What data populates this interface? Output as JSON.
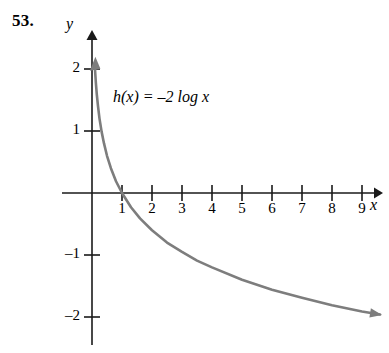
{
  "figure": {
    "problem_number": "53.",
    "equation": {
      "function_name": "h",
      "argument": "x",
      "full_text": "h(x) = –2 log x",
      "coefficient": "–2",
      "base_function": "log"
    },
    "axes": {
      "x_label": "x",
      "y_label": "y",
      "x_ticks": [
        "1",
        "2",
        "3",
        "4",
        "5",
        "6",
        "7",
        "8",
        "9"
      ],
      "y_ticks": [
        "2",
        "1",
        "–1",
        "–2"
      ],
      "x_range": [
        -0.9,
        9.9
      ],
      "y_range": [
        -2.4,
        2.5
      ],
      "grid": false,
      "axis_color": "#1a1a1a"
    },
    "curve": {
      "color": "#7d7d7d",
      "width": 2.6,
      "arrow_start": "up",
      "arrow_end": "right"
    }
  },
  "chart_data": {
    "type": "line",
    "title": "",
    "xlabel": "x",
    "ylabel": "y",
    "xlim": [
      -0.9,
      9.9
    ],
    "ylim": [
      -2.4,
      2.5
    ],
    "grid": false,
    "legend": null,
    "annotations": [
      "h(x) = –2 log x"
    ],
    "series": [
      {
        "name": "h(x) = -2 log x",
        "x": [
          0.097,
          0.11,
          0.13,
          0.16,
          0.2,
          0.25,
          0.32,
          0.4,
          0.5,
          0.63,
          0.8,
          1.0,
          1.3,
          1.6,
          2.0,
          2.5,
          3.0,
          3.5,
          4.0,
          5.0,
          6.0,
          7.0,
          8.0,
          9.0,
          9.6
        ],
        "y": [
          2.02,
          1.92,
          1.77,
          1.59,
          1.4,
          1.2,
          0.99,
          0.8,
          0.6,
          0.4,
          0.19,
          0.0,
          -0.23,
          -0.41,
          -0.6,
          -0.8,
          -0.95,
          -1.09,
          -1.2,
          -1.4,
          -1.56,
          -1.69,
          -1.81,
          -1.91,
          -1.96
        ]
      }
    ]
  }
}
